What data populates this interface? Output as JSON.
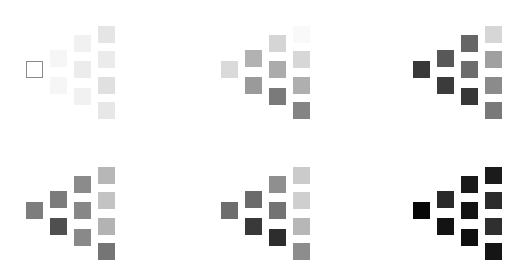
{
  "figure": {
    "layout": {
      "rows": 2,
      "cols": 3
    },
    "panels": [
      {
        "id": 1,
        "x": 26,
        "y": 61,
        "first_outline": true,
        "colors": [
          "#ffffff",
          "#f6f6f6",
          "#f6f6f6",
          "#f1f1f1",
          "#ececec",
          "#f1f1f1",
          "#e5e5e5",
          "#ebebeb",
          "#e0e0e0",
          "#e7e7e7"
        ]
      },
      {
        "id": 2,
        "x": 221,
        "y": 61,
        "first_outline": false,
        "colors": [
          "#dadada",
          "#b2b2b2",
          "#9a9a9a",
          "#d5d5d5",
          "#ababab",
          "#7a7a7a",
          "#f9f9f9",
          "#d7d7d7",
          "#afafaf",
          "#848484"
        ]
      },
      {
        "id": 3,
        "x": 413,
        "y": 61,
        "first_outline": false,
        "colors": [
          "#383838",
          "#585858",
          "#3b3b3b",
          "#666666",
          "#6c6c6c",
          "#373737",
          "#d6d6d6",
          "#a0a0a0",
          "#8b8b8b",
          "#797979"
        ]
      },
      {
        "id": 4,
        "x": 26,
        "y": 202,
        "first_outline": false,
        "colors": [
          "#7d7d7d",
          "#7b7b7b",
          "#4f4f4f",
          "#8b8b8b",
          "#878787",
          "#898989",
          "#b7b7b7",
          "#c3c3c3",
          "#b3b3b3",
          "#757575"
        ]
      },
      {
        "id": 5,
        "x": 221,
        "y": 202,
        "first_outline": false,
        "colors": [
          "#6d6d6d",
          "#6b6b6b",
          "#393939",
          "#8f8f8f",
          "#737373",
          "#2d2d2d",
          "#cbcbcb",
          "#cfcfcf",
          "#b7b7b7",
          "#8d8d8d"
        ]
      },
      {
        "id": 6,
        "x": 413,
        "y": 202,
        "first_outline": false,
        "colors": [
          "#070707",
          "#292929",
          "#131313",
          "#191919",
          "#131313",
          "#0f0f0f",
          "#1b1b1b",
          "#2b2b2b",
          "#2f2f2f",
          "#151515"
        ]
      }
    ],
    "cell_offsets": [
      [
        0,
        0
      ],
      [
        24,
        -11
      ],
      [
        24,
        16
      ],
      [
        48,
        -26
      ],
      [
        48,
        0
      ],
      [
        48,
        27
      ],
      [
        72,
        -35
      ],
      [
        72,
        -10
      ],
      [
        72,
        16
      ],
      [
        72,
        41
      ]
    ],
    "cell_size": 17
  }
}
